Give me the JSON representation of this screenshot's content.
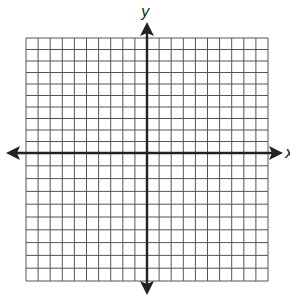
{
  "diagram": {
    "type": "coordinate-plane",
    "axes": {
      "x_label": "x",
      "y_label": "y"
    },
    "grid": {
      "columns_left_of_y_axis": 10,
      "columns_right_of_y_axis": 10,
      "rows_above_x_axis": 10,
      "rows_below_x_axis": 10,
      "bounds": {
        "left": 26,
        "right": 268,
        "top": 38,
        "bottom": 281
      },
      "origin": {
        "x": 147,
        "y": 153
      }
    },
    "colors": {
      "grid_line": "#555555",
      "axis": "#222222",
      "background": "#ffffff"
    }
  }
}
